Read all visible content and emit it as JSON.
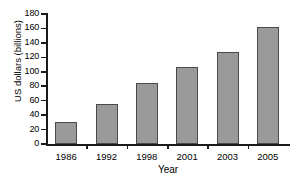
{
  "chart_data": {
    "type": "bar",
    "title": "",
    "categories": [
      "1986",
      "1992",
      "1998",
      "2001",
      "2003",
      "2005"
    ],
    "values": [
      30,
      56,
      85,
      107,
      127,
      162
    ],
    "xlabel": "Year",
    "ylabel": "US dollars (billions)",
    "ylim": [
      0,
      180
    ],
    "yticks": [
      0,
      20,
      40,
      60,
      80,
      100,
      120,
      140,
      160,
      180
    ],
    "ytick_labels": [
      "0",
      "20",
      "40",
      "60",
      "80",
      "100",
      "120",
      "140",
      "160",
      "180"
    ],
    "grid": false,
    "legend": false,
    "bar_color": "#9a9a9a",
    "bar_edge_color": "#4a4a4a",
    "axis_color": "#1a1a1a",
    "background": "#ffffff"
  }
}
